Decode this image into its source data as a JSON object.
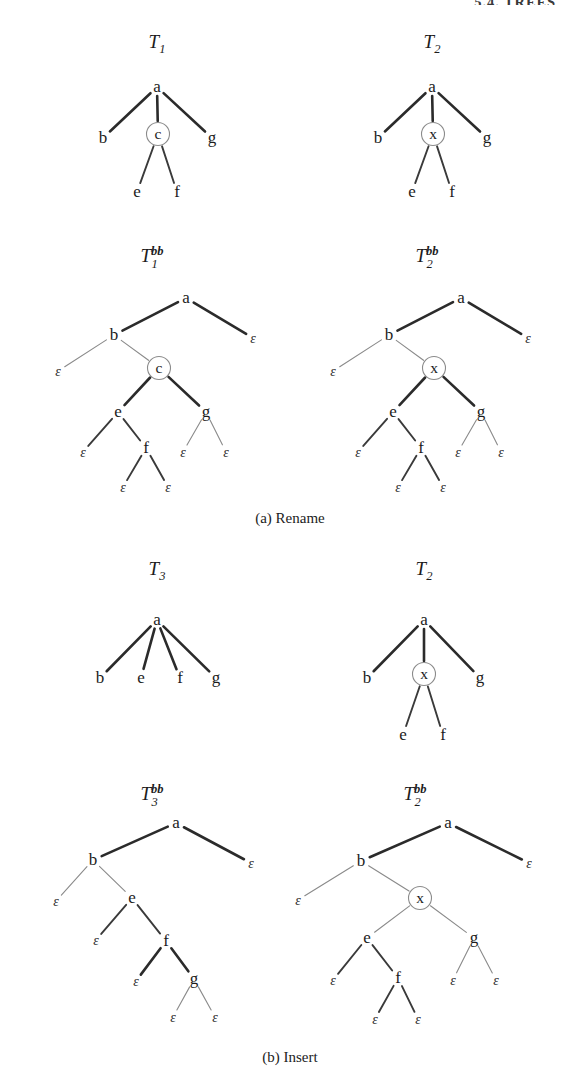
{
  "page": {
    "running_head": "5.4.  TREES",
    "background": "#ffffff",
    "ink": "#1c1c1c",
    "width": 580,
    "height": 1078
  },
  "captions": [
    {
      "id": "caption-a",
      "label": "(a)  Rename",
      "x": 290,
      "y": 523
    },
    {
      "id": "caption-b",
      "label": "(b)  Insert",
      "x": 290,
      "y": 1062
    }
  ],
  "trees": [
    {
      "id": "tree-t1",
      "title": {
        "base": "T",
        "sub": "1",
        "sup": "",
        "x": 157,
        "y": 48
      },
      "kind": "ordered",
      "nodes": [
        {
          "id": "a",
          "label": "a",
          "x": 157,
          "y": 92,
          "circled": false
        },
        {
          "id": "b",
          "label": "b",
          "x": 103,
          "y": 143,
          "circled": false
        },
        {
          "id": "c",
          "label": "c",
          "x": 158,
          "y": 139,
          "circled": true
        },
        {
          "id": "g",
          "label": "g",
          "x": 212,
          "y": 143,
          "circled": false
        },
        {
          "id": "e",
          "label": "e",
          "x": 137,
          "y": 197,
          "circled": false
        },
        {
          "id": "f",
          "label": "f",
          "x": 177,
          "y": 197,
          "circled": false
        }
      ],
      "edges": [
        {
          "from": "a",
          "to": "b",
          "weight": "heavy"
        },
        {
          "from": "a",
          "to": "c",
          "weight": "heavy"
        },
        {
          "from": "a",
          "to": "g",
          "weight": "heavy"
        },
        {
          "from": "c",
          "to": "e",
          "weight": "medium"
        },
        {
          "from": "c",
          "to": "f",
          "weight": "medium"
        }
      ]
    },
    {
      "id": "tree-t2-top",
      "title": {
        "base": "T",
        "sub": "2",
        "sup": "",
        "x": 432,
        "y": 48
      },
      "kind": "ordered",
      "nodes": [
        {
          "id": "a",
          "label": "a",
          "x": 432,
          "y": 92,
          "circled": false
        },
        {
          "id": "b",
          "label": "b",
          "x": 378,
          "y": 143,
          "circled": false
        },
        {
          "id": "x",
          "label": "x",
          "x": 433,
          "y": 139,
          "circled": true
        },
        {
          "id": "g",
          "label": "g",
          "x": 487,
          "y": 143,
          "circled": false
        },
        {
          "id": "e",
          "label": "e",
          "x": 412,
          "y": 197,
          "circled": false
        },
        {
          "id": "f",
          "label": "f",
          "x": 452,
          "y": 197,
          "circled": false
        }
      ],
      "edges": [
        {
          "from": "a",
          "to": "b",
          "weight": "heavy"
        },
        {
          "from": "a",
          "to": "x",
          "weight": "heavy"
        },
        {
          "from": "a",
          "to": "g",
          "weight": "heavy"
        },
        {
          "from": "x",
          "to": "e",
          "weight": "medium"
        },
        {
          "from": "x",
          "to": "f",
          "weight": "medium"
        }
      ]
    },
    {
      "id": "tree-t1bb",
      "title": {
        "base": "T",
        "sub": "1",
        "sup": "bb",
        "x": 152,
        "y": 262
      },
      "kind": "binary-branching",
      "nodes": [
        {
          "id": "a",
          "label": "a",
          "x": 186,
          "y": 303,
          "circled": false
        },
        {
          "id": "b",
          "label": "b",
          "x": 114,
          "y": 340,
          "circled": false
        },
        {
          "id": "eps1",
          "label": "ε",
          "x": 253,
          "y": 343,
          "circled": false,
          "epsilon": true
        },
        {
          "id": "eps2",
          "label": "ε",
          "x": 58,
          "y": 376,
          "circled": false,
          "epsilon": true
        },
        {
          "id": "c",
          "label": "c",
          "x": 159,
          "y": 373,
          "circled": true
        },
        {
          "id": "e",
          "label": "e",
          "x": 118,
          "y": 417,
          "circled": false
        },
        {
          "id": "g",
          "label": "g",
          "x": 206,
          "y": 417,
          "circled": false
        },
        {
          "id": "eps3",
          "label": "ε",
          "x": 83,
          "y": 457,
          "circled": false,
          "epsilon": true
        },
        {
          "id": "f",
          "label": "f",
          "x": 146,
          "y": 453,
          "circled": false
        },
        {
          "id": "eps4",
          "label": "ε",
          "x": 183,
          "y": 457,
          "circled": false,
          "epsilon": true
        },
        {
          "id": "eps5",
          "label": "ε",
          "x": 226,
          "y": 457,
          "circled": false,
          "epsilon": true
        },
        {
          "id": "eps6",
          "label": "ε",
          "x": 123,
          "y": 492,
          "circled": false,
          "epsilon": true
        },
        {
          "id": "eps7",
          "label": "ε",
          "x": 168,
          "y": 492,
          "circled": false,
          "epsilon": true
        }
      ],
      "edges": [
        {
          "from": "a",
          "to": "b",
          "weight": "heavy"
        },
        {
          "from": "a",
          "to": "eps1",
          "weight": "heavy"
        },
        {
          "from": "b",
          "to": "eps2",
          "weight": "light"
        },
        {
          "from": "b",
          "to": "c",
          "weight": "light"
        },
        {
          "from": "c",
          "to": "e",
          "weight": "heavy"
        },
        {
          "from": "c",
          "to": "g",
          "weight": "heavy"
        },
        {
          "from": "e",
          "to": "eps3",
          "weight": "medium"
        },
        {
          "from": "e",
          "to": "f",
          "weight": "medium"
        },
        {
          "from": "g",
          "to": "eps4",
          "weight": "light"
        },
        {
          "from": "g",
          "to": "eps5",
          "weight": "light"
        },
        {
          "from": "f",
          "to": "eps6",
          "weight": "medium"
        },
        {
          "from": "f",
          "to": "eps7",
          "weight": "medium"
        }
      ]
    },
    {
      "id": "tree-t2bb-top",
      "title": {
        "base": "T",
        "sub": "2",
        "sup": "bb",
        "x": 427,
        "y": 262
      },
      "kind": "binary-branching",
      "nodes": [
        {
          "id": "a",
          "label": "a",
          "x": 461,
          "y": 303,
          "circled": false
        },
        {
          "id": "b",
          "label": "b",
          "x": 389,
          "y": 340,
          "circled": false
        },
        {
          "id": "eps1",
          "label": "ε",
          "x": 528,
          "y": 343,
          "circled": false,
          "epsilon": true
        },
        {
          "id": "eps2",
          "label": "ε",
          "x": 333,
          "y": 376,
          "circled": false,
          "epsilon": true
        },
        {
          "id": "x",
          "label": "x",
          "x": 434,
          "y": 373,
          "circled": true
        },
        {
          "id": "e",
          "label": "e",
          "x": 393,
          "y": 417,
          "circled": false
        },
        {
          "id": "g",
          "label": "g",
          "x": 481,
          "y": 417,
          "circled": false
        },
        {
          "id": "eps3",
          "label": "ε",
          "x": 358,
          "y": 457,
          "circled": false,
          "epsilon": true
        },
        {
          "id": "f",
          "label": "f",
          "x": 421,
          "y": 453,
          "circled": false
        },
        {
          "id": "eps4",
          "label": "ε",
          "x": 458,
          "y": 457,
          "circled": false,
          "epsilon": true
        },
        {
          "id": "eps5",
          "label": "ε",
          "x": 501,
          "y": 457,
          "circled": false,
          "epsilon": true
        },
        {
          "id": "eps6",
          "label": "ε",
          "x": 398,
          "y": 492,
          "circled": false,
          "epsilon": true
        },
        {
          "id": "eps7",
          "label": "ε",
          "x": 443,
          "y": 492,
          "circled": false,
          "epsilon": true
        }
      ],
      "edges": [
        {
          "from": "a",
          "to": "b",
          "weight": "heavy"
        },
        {
          "from": "a",
          "to": "eps1",
          "weight": "heavy"
        },
        {
          "from": "b",
          "to": "eps2",
          "weight": "light"
        },
        {
          "from": "b",
          "to": "x",
          "weight": "light"
        },
        {
          "from": "x",
          "to": "e",
          "weight": "heavy"
        },
        {
          "from": "x",
          "to": "g",
          "weight": "heavy"
        },
        {
          "from": "e",
          "to": "eps3",
          "weight": "medium"
        },
        {
          "from": "e",
          "to": "f",
          "weight": "medium"
        },
        {
          "from": "g",
          "to": "eps4",
          "weight": "light"
        },
        {
          "from": "g",
          "to": "eps5",
          "weight": "light"
        },
        {
          "from": "f",
          "to": "eps6",
          "weight": "medium"
        },
        {
          "from": "f",
          "to": "eps7",
          "weight": "medium"
        }
      ]
    },
    {
      "id": "tree-t3",
      "title": {
        "base": "T",
        "sub": "3",
        "sup": "",
        "x": 157,
        "y": 575
      },
      "kind": "ordered",
      "nodes": [
        {
          "id": "a",
          "label": "a",
          "x": 157,
          "y": 625,
          "circled": false
        },
        {
          "id": "b",
          "label": "b",
          "x": 100,
          "y": 683,
          "circled": false
        },
        {
          "id": "e",
          "label": "e",
          "x": 141,
          "y": 683,
          "circled": false
        },
        {
          "id": "f",
          "label": "f",
          "x": 180,
          "y": 683,
          "circled": false
        },
        {
          "id": "g",
          "label": "g",
          "x": 216,
          "y": 683,
          "circled": false
        }
      ],
      "edges": [
        {
          "from": "a",
          "to": "b",
          "weight": "heavy"
        },
        {
          "from": "a",
          "to": "e",
          "weight": "heavy"
        },
        {
          "from": "a",
          "to": "f",
          "weight": "heavy"
        },
        {
          "from": "a",
          "to": "g",
          "weight": "heavy"
        }
      ]
    },
    {
      "id": "tree-t2-bottom",
      "title": {
        "base": "T",
        "sub": "2",
        "sup": "",
        "x": 424,
        "y": 575
      },
      "kind": "ordered",
      "nodes": [
        {
          "id": "a",
          "label": "a",
          "x": 424,
          "y": 625,
          "circled": false
        },
        {
          "id": "b",
          "label": "b",
          "x": 367,
          "y": 683,
          "circled": false
        },
        {
          "id": "x",
          "label": "x",
          "x": 424,
          "y": 679,
          "circled": true
        },
        {
          "id": "g",
          "label": "g",
          "x": 480,
          "y": 683,
          "circled": false
        },
        {
          "id": "e",
          "label": "e",
          "x": 403,
          "y": 740,
          "circled": false
        },
        {
          "id": "f",
          "label": "f",
          "x": 443,
          "y": 740,
          "circled": false
        }
      ],
      "edges": [
        {
          "from": "a",
          "to": "b",
          "weight": "heavy"
        },
        {
          "from": "a",
          "to": "x",
          "weight": "heavy"
        },
        {
          "from": "a",
          "to": "g",
          "weight": "heavy"
        },
        {
          "from": "x",
          "to": "e",
          "weight": "medium"
        },
        {
          "from": "x",
          "to": "f",
          "weight": "medium"
        }
      ]
    },
    {
      "id": "tree-t3bb",
      "title": {
        "base": "T",
        "sub": "3",
        "sup": "bb",
        "x": 152,
        "y": 800
      },
      "kind": "binary-branching",
      "nodes": [
        {
          "id": "a",
          "label": "a",
          "x": 176,
          "y": 828,
          "circled": false
        },
        {
          "id": "b",
          "label": "b",
          "x": 93,
          "y": 865,
          "circled": false
        },
        {
          "id": "eps1",
          "label": "ε",
          "x": 251,
          "y": 868,
          "circled": false,
          "epsilon": true
        },
        {
          "id": "eps2",
          "label": "ε",
          "x": 56,
          "y": 906,
          "circled": false,
          "epsilon": true
        },
        {
          "id": "e",
          "label": "e",
          "x": 132,
          "y": 903,
          "circled": false
        },
        {
          "id": "eps3",
          "label": "ε",
          "x": 96,
          "y": 945,
          "circled": false,
          "epsilon": true
        },
        {
          "id": "f",
          "label": "f",
          "x": 166,
          "y": 946,
          "circled": false
        },
        {
          "id": "eps4",
          "label": "ε",
          "x": 136,
          "y": 986,
          "circled": false,
          "epsilon": true
        },
        {
          "id": "g",
          "label": "g",
          "x": 194,
          "y": 984,
          "circled": false
        },
        {
          "id": "eps5",
          "label": "ε",
          "x": 173,
          "y": 1022,
          "circled": false,
          "epsilon": true
        },
        {
          "id": "eps6",
          "label": "ε",
          "x": 215,
          "y": 1022,
          "circled": false,
          "epsilon": true
        }
      ],
      "edges": [
        {
          "from": "a",
          "to": "b",
          "weight": "heavy"
        },
        {
          "from": "a",
          "to": "eps1",
          "weight": "heavy"
        },
        {
          "from": "b",
          "to": "eps2",
          "weight": "light"
        },
        {
          "from": "b",
          "to": "e",
          "weight": "light"
        },
        {
          "from": "e",
          "to": "eps3",
          "weight": "medium"
        },
        {
          "from": "e",
          "to": "f",
          "weight": "medium"
        },
        {
          "from": "f",
          "to": "eps4",
          "weight": "heavy"
        },
        {
          "from": "f",
          "to": "g",
          "weight": "heavy"
        },
        {
          "from": "g",
          "to": "eps5",
          "weight": "light"
        },
        {
          "from": "g",
          "to": "eps6",
          "weight": "light"
        }
      ]
    },
    {
      "id": "tree-t2bb-bottom",
      "title": {
        "base": "T",
        "sub": "2",
        "sup": "bb",
        "x": 415,
        "y": 800
      },
      "kind": "binary-branching",
      "nodes": [
        {
          "id": "a",
          "label": "a",
          "x": 448,
          "y": 828,
          "circled": false
        },
        {
          "id": "b",
          "label": "b",
          "x": 361,
          "y": 866,
          "circled": false
        },
        {
          "id": "eps1",
          "label": "ε",
          "x": 529,
          "y": 868,
          "circled": false,
          "epsilon": true
        },
        {
          "id": "eps2",
          "label": "ε",
          "x": 298,
          "y": 905,
          "circled": false,
          "epsilon": true
        },
        {
          "id": "x",
          "label": "x",
          "x": 420,
          "y": 903,
          "circled": true
        },
        {
          "id": "e",
          "label": "e",
          "x": 367,
          "y": 943,
          "circled": false
        },
        {
          "id": "g",
          "label": "g",
          "x": 474,
          "y": 943,
          "circled": false
        },
        {
          "id": "eps3",
          "label": "ε",
          "x": 333,
          "y": 985,
          "circled": false,
          "epsilon": true
        },
        {
          "id": "f",
          "label": "f",
          "x": 398,
          "y": 983,
          "circled": false
        },
        {
          "id": "eps4",
          "label": "ε",
          "x": 453,
          "y": 985,
          "circled": false,
          "epsilon": true
        },
        {
          "id": "eps5",
          "label": "ε",
          "x": 496,
          "y": 985,
          "circled": false,
          "epsilon": true
        },
        {
          "id": "eps6",
          "label": "ε",
          "x": 375,
          "y": 1024,
          "circled": false,
          "epsilon": true
        },
        {
          "id": "eps7",
          "label": "ε",
          "x": 418,
          "y": 1024,
          "circled": false,
          "epsilon": true
        }
      ],
      "edges": [
        {
          "from": "a",
          "to": "b",
          "weight": "heavy"
        },
        {
          "from": "a",
          "to": "eps1",
          "weight": "heavy"
        },
        {
          "from": "b",
          "to": "eps2",
          "weight": "light"
        },
        {
          "from": "b",
          "to": "x",
          "weight": "light"
        },
        {
          "from": "x",
          "to": "e",
          "weight": "light"
        },
        {
          "from": "x",
          "to": "g",
          "weight": "light"
        },
        {
          "from": "e",
          "to": "eps3",
          "weight": "medium"
        },
        {
          "from": "e",
          "to": "f",
          "weight": "medium"
        },
        {
          "from": "g",
          "to": "eps4",
          "weight": "light"
        },
        {
          "from": "g",
          "to": "eps5",
          "weight": "light"
        },
        {
          "from": "f",
          "to": "eps6",
          "weight": "medium"
        },
        {
          "from": "f",
          "to": "eps7",
          "weight": "medium"
        }
      ]
    }
  ],
  "style": {
    "edge_weights": {
      "heavy": 2.6,
      "medium": 1.9,
      "light": 1.1
    },
    "edge_colors": {
      "heavy": "#2b2b2b",
      "medium": "#3a3a3a",
      "light": "#8a8a8a"
    },
    "node_radius": 11.5,
    "label_gap_top": 12,
    "label_gap_bottom": 8
  }
}
